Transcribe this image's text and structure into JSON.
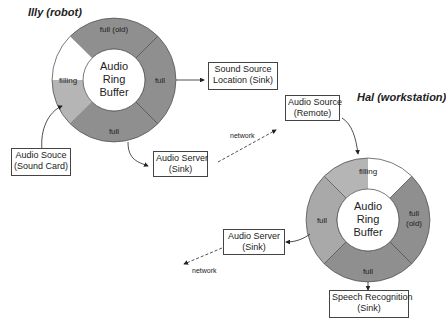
{
  "colors": {
    "dark": "#8a8a8a",
    "medium": "#a8a8a8",
    "light": "#bdbdbd",
    "empty": "#ffffff",
    "stroke": "#444444"
  },
  "robot": {
    "title_name": "Illy",
    "title_role": "robot",
    "ring": {
      "center_lines": [
        "Audio",
        "Ring",
        "Buffer"
      ],
      "segments": [
        {
          "label": "full (old)",
          "state": "full-old"
        },
        {
          "label": "full",
          "state": "full"
        },
        {
          "label": "full",
          "state": "full"
        },
        {
          "label": "filling",
          "state": "filling"
        }
      ]
    },
    "boxes": {
      "sound_source_location": {
        "line1": "Sound Source",
        "line2": "Location (Sink)"
      },
      "audio_souce": {
        "line1": "Audio Souce",
        "line2": "(Sound Card)"
      },
      "audio_server": {
        "line1": "Audio Server",
        "line2": "(Sink)"
      }
    }
  },
  "workstation": {
    "title_name": "Hal",
    "title_role": "workstation",
    "ring": {
      "center_lines": [
        "Audio",
        "Ring",
        "Buffer"
      ],
      "segments": [
        {
          "label": "filling",
          "state": "filling"
        },
        {
          "label": "full (old)",
          "state": "full-old"
        },
        {
          "label": "full",
          "state": "full"
        },
        {
          "label": "full",
          "state": "full"
        }
      ]
    },
    "boxes": {
      "audio_source_remote": {
        "line1": "Audio Source",
        "line2": "(Remote)"
      },
      "audio_server": {
        "line1": "Audio Server",
        "line2": "(Sink)"
      },
      "speech_recognition": {
        "line1": "Speech Recognition",
        "line2": "(Sink)"
      }
    }
  },
  "network_labels": [
    "network",
    "network"
  ]
}
